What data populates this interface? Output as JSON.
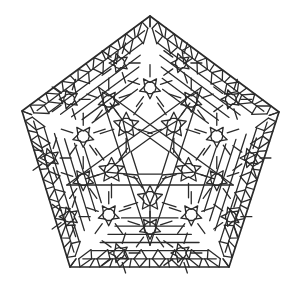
{
  "figure": {
    "title": "Pentagonal geometric tiling pattern",
    "symmetry": 5,
    "center": [
      150,
      158
    ],
    "outer_vertices": [
      [
        150,
        16
      ],
      [
        279,
        112
      ],
      [
        229,
        267
      ],
      [
        70,
        267
      ],
      [
        22,
        111
      ]
    ],
    "stroke_color": "#2b2b2b",
    "background_color": "#ffffff",
    "stroke_width": 1.3,
    "edge_bands": 6,
    "edge_subdivisions": 8,
    "rosette_rings": [
      {
        "radius": 0.3,
        "count": 5,
        "size": 13,
        "rotation": 36
      },
      {
        "radius": 0.52,
        "count": 10,
        "size": 11,
        "rotation": 0
      },
      {
        "radius": 0.74,
        "count": 10,
        "size": 10,
        "rotation": 18
      }
    ],
    "center_pentagon_radius": 20,
    "center_star_radius": 46
  }
}
